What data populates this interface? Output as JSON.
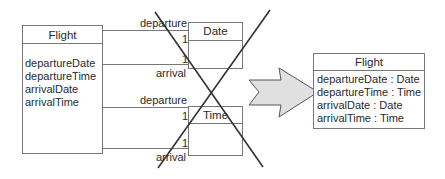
{
  "before": {
    "flight_class": {
      "name": "Flight",
      "attributes": [
        "departureDate",
        "departureTime",
        "arrivalDate",
        "arrivalTime"
      ]
    },
    "date_class": {
      "name": "Date"
    },
    "time_class": {
      "name": "Time"
    },
    "date_associations": {
      "top_role": "departure",
      "top_multiplicity": "1",
      "bottom_role": "arrival",
      "bottom_multiplicity": "1"
    },
    "time_associations": {
      "top_role": "departure",
      "top_multiplicity": "1",
      "bottom_role": "arrival",
      "bottom_multiplicity": "1"
    },
    "crossed_out": true
  },
  "arrow": {
    "fill": "#e0e0e0",
    "stroke": "#555555"
  },
  "after": {
    "flight_class": {
      "name": "Flight",
      "attributes": [
        "departureDate : Date",
        "departureTime : Time",
        "arrivalDate : Date",
        "arrivalTime : Time"
      ]
    }
  },
  "colors": {
    "line": "#777777",
    "cross": "#333333"
  }
}
